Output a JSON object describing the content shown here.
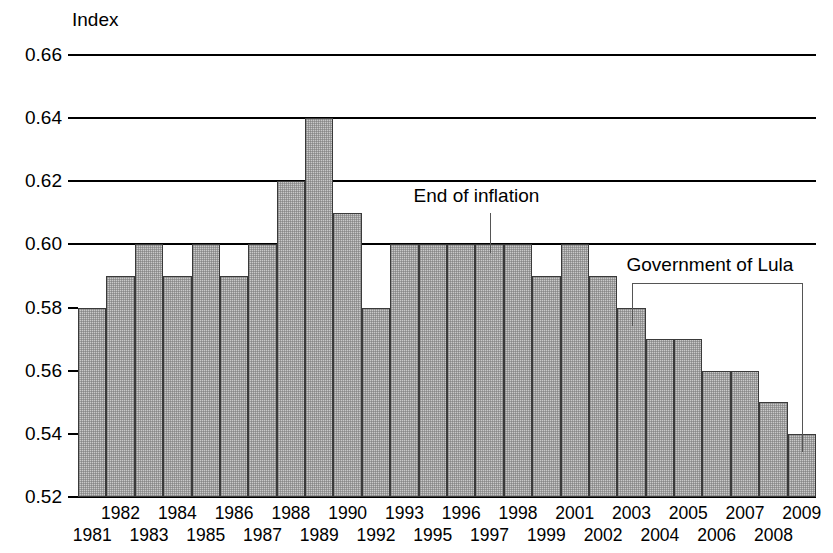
{
  "chart_data": {
    "type": "bar",
    "title": "",
    "subtitle": "",
    "xlabel": "",
    "ylabel": "Index",
    "ylim": [
      0.52,
      0.66
    ],
    "ytick_labels": [
      "0.66",
      "0.64",
      "0.62",
      "0.60",
      "0.58",
      "0.56",
      "0.54",
      "0.52"
    ],
    "ytick_values": [
      0.66,
      0.64,
      0.62,
      0.6,
      0.58,
      0.56,
      0.54,
      0.52
    ],
    "gridlines_at": [
      0.66,
      0.64,
      0.62,
      0.6
    ],
    "grid": true,
    "legend": "none",
    "categories": [
      "1981",
      "1982",
      "1983",
      "1984",
      "1985",
      "1986",
      "1987",
      "1988",
      "1989",
      "1990",
      "1992",
      "1993",
      "1995",
      "1996",
      "1997",
      "1998",
      "1999",
      "2001",
      "2002",
      "2003",
      "2004",
      "2005",
      "2006",
      "2007",
      "2008",
      "2009"
    ],
    "values": [
      0.58,
      0.59,
      0.6,
      0.59,
      0.6,
      0.59,
      0.6,
      0.62,
      0.64,
      0.61,
      0.58,
      0.6,
      0.6,
      0.6,
      0.6,
      0.6,
      0.59,
      0.6,
      0.59,
      0.58,
      0.57,
      0.57,
      0.56,
      0.56,
      0.55,
      0.54
    ],
    "xtick_labels_top": [
      "1982",
      "1984",
      "1986",
      "1988",
      "1990",
      "1993",
      "1996",
      "1998",
      "2001",
      "2003",
      "2005",
      "2007",
      "2009"
    ],
    "xtick_labels_bottom": [
      "1981",
      "1983",
      "1985",
      "1987",
      "1989",
      "1992",
      "1995",
      "1997",
      "1999",
      "2002",
      "2004",
      "2006",
      "2008"
    ],
    "annotations": [
      {
        "text": "End of inflation",
        "anchor_category": "1997"
      },
      {
        "text": "Government of Lula",
        "span_start_category": "2003",
        "span_end_category": "2009"
      }
    ],
    "colors": {
      "bar_fill": "#c9c9c9",
      "bar_edge": "#3a3a3a",
      "axis": "#000000",
      "annotation": "#555555",
      "background": "#ffffff"
    }
  }
}
